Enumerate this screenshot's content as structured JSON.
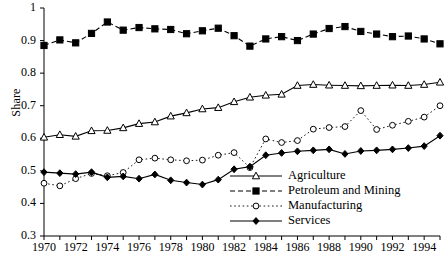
{
  "chart_data": {
    "type": "line",
    "title": "",
    "xlabel": "",
    "ylabel": "Share",
    "xlim": [
      1970,
      1995
    ],
    "ylim": [
      0.3,
      1.0
    ],
    "grid": false,
    "legend_position": "lower-right",
    "x": [
      1970,
      1971,
      1972,
      1973,
      1974,
      1975,
      1976,
      1977,
      1978,
      1979,
      1980,
      1981,
      1982,
      1983,
      1984,
      1985,
      1986,
      1987,
      1988,
      1989,
      1990,
      1991,
      1992,
      1993,
      1994,
      1995
    ],
    "xticks": [
      1970,
      1971,
      1972,
      1973,
      1974,
      1975,
      1976,
      1977,
      1978,
      1979,
      1980,
      1981,
      1982,
      1983,
      1984,
      1985,
      1986,
      1987,
      1988,
      1989,
      1990,
      1991,
      1992,
      1993,
      1994,
      1995
    ],
    "xticklabels": [
      "1970",
      "",
      "1972",
      "",
      "1974",
      "",
      "1976",
      "",
      "1978",
      "",
      "1980",
      "",
      "1982",
      "",
      "1984",
      "",
      "1986",
      "",
      "1988",
      "",
      "1990",
      "",
      "1992",
      "",
      "1994",
      ""
    ],
    "yticks": [
      0.3,
      0.4,
      0.5,
      0.6,
      0.7,
      0.8,
      0.9,
      1.0
    ],
    "yticklabels": [
      "0.3",
      "0.4",
      "0.5",
      "0.6",
      "0.7",
      "0.8",
      "0.9",
      "1"
    ],
    "series": [
      {
        "name": "Agriculture",
        "marker": "triangle-open",
        "linestyle": "solid",
        "color": "#000000",
        "values": [
          0.603,
          0.611,
          0.606,
          0.623,
          0.624,
          0.632,
          0.645,
          0.65,
          0.668,
          0.678,
          0.69,
          0.694,
          0.712,
          0.726,
          0.732,
          0.735,
          0.762,
          0.765,
          0.763,
          0.762,
          0.761,
          0.762,
          0.763,
          0.762,
          0.765,
          0.772
        ]
      },
      {
        "name": "Petroleum and Mining",
        "marker": "square-filled",
        "linestyle": "dashed",
        "color": "#000000",
        "values": [
          0.885,
          0.902,
          0.893,
          0.922,
          0.957,
          0.932,
          0.94,
          0.936,
          0.934,
          0.921,
          0.93,
          0.938,
          0.915,
          0.883,
          0.905,
          0.912,
          0.9,
          0.92,
          0.937,
          0.943,
          0.928,
          0.92,
          0.912,
          0.914,
          0.905,
          0.89
        ]
      },
      {
        "name": "Manufacturing",
        "marker": "circle-open",
        "linestyle": "dotted",
        "color": "#000000",
        "values": [
          0.462,
          0.454,
          0.476,
          0.492,
          0.485,
          0.495,
          0.534,
          0.539,
          0.534,
          0.531,
          0.533,
          0.548,
          0.556,
          0.51,
          0.598,
          0.587,
          0.593,
          0.628,
          0.633,
          0.636,
          0.685,
          0.627,
          0.64,
          0.652,
          0.665,
          0.7
        ]
      },
      {
        "name": "Services",
        "marker": "diamond-filled",
        "linestyle": "solid",
        "color": "#000000",
        "values": [
          0.496,
          0.493,
          0.49,
          0.496,
          0.48,
          0.483,
          0.476,
          0.489,
          0.471,
          0.464,
          0.458,
          0.473,
          0.505,
          0.513,
          0.548,
          0.555,
          0.56,
          0.563,
          0.566,
          0.552,
          0.561,
          0.563,
          0.566,
          0.57,
          0.576,
          0.608
        ]
      }
    ]
  },
  "legend": {
    "items": [
      {
        "label": "Agriculture"
      },
      {
        "label": "Petroleum and Mining"
      },
      {
        "label": "Manufacturing"
      },
      {
        "label": "Services"
      }
    ]
  }
}
